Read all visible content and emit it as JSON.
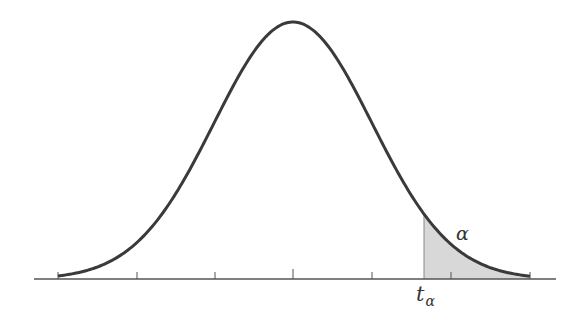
{
  "diagram": {
    "type": "t-distribution upper tail probability",
    "labels": {
      "tail_area": "α",
      "critical_value_base": "t",
      "critical_value_sub": "α"
    },
    "colors": {
      "curve": "#3a3a3a",
      "axis": "#555555",
      "shade": "#d6d6d6"
    },
    "axis": {
      "tick_count": 7
    }
  }
}
